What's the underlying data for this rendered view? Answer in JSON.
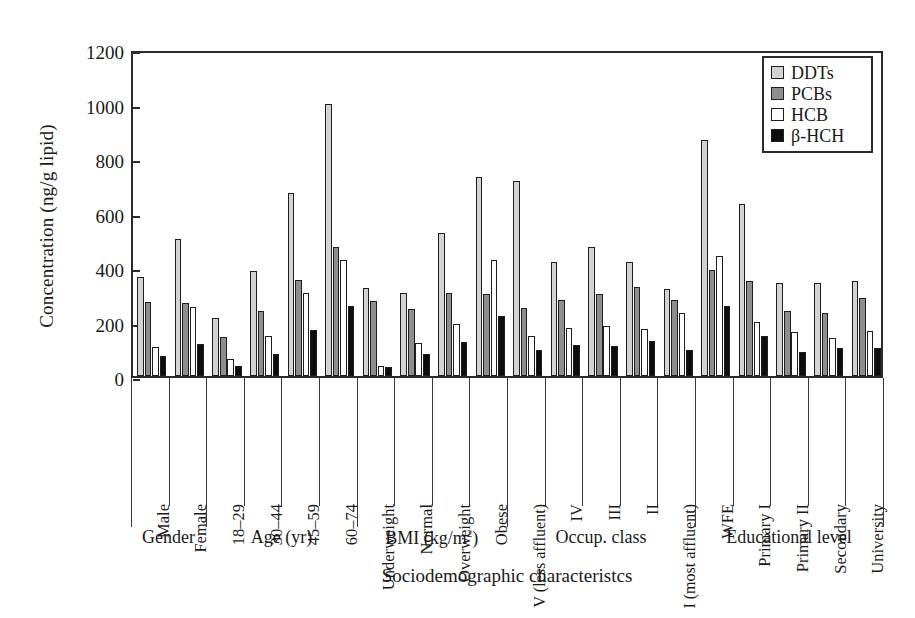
{
  "chart_data": {
    "type": "bar",
    "title": "",
    "xlabel": "Sociodemographic characteristcs",
    "ylabel": "Concentration (ng/g lipid)",
    "ylim": [
      0,
      1200
    ],
    "yticks": [
      0,
      200,
      400,
      600,
      800,
      1000,
      1200
    ],
    "grid": false,
    "legend_position": "top-right",
    "categories": [
      "Male",
      "Female",
      "18–29",
      "30–44",
      "45–59",
      "60–74",
      "Underweight",
      "Normal",
      "Overweight",
      "Obese",
      "V (less affluent)",
      "IV",
      "III",
      "II",
      "I (most affluent)",
      "WFE",
      "Primary I",
      "Primary II",
      "Secondary",
      "University"
    ],
    "series": [
      {
        "name": "DDTs",
        "color": "#d3d3d3",
        "values": [
          365,
          502,
          213,
          387,
          670,
          1000,
          322,
          305,
          525,
          730,
          715,
          420,
          472,
          420,
          320,
          865,
          630,
          340,
          342,
          350
        ]
      },
      {
        "name": "PCBs",
        "color": "#8e8e8e",
        "values": [
          272,
          268,
          145,
          240,
          352,
          475,
          277,
          245,
          303,
          300,
          250,
          280,
          300,
          325,
          280,
          390,
          348,
          240,
          232,
          285
        ]
      },
      {
        "name": "HCB",
        "color": "#ffffff",
        "values": [
          105,
          252,
          62,
          148,
          305,
          425,
          38,
          122,
          192,
          425,
          147,
          178,
          182,
          172,
          232,
          440,
          198,
          160,
          138,
          165
        ]
      },
      {
        "name": "β-HCH",
        "color": "#0d0d0d",
        "values": [
          72,
          118,
          35,
          82,
          170,
          258,
          33,
          80,
          125,
          222,
          95,
          112,
          110,
          128,
          95,
          258,
          148,
          88,
          102,
          102
        ]
      }
    ],
    "supergroups": [
      {
        "label": "Gender",
        "label_html": "Gender",
        "span": [
          0,
          2
        ]
      },
      {
        "label": "Age (yr)",
        "label_html": "Age (yr)",
        "span": [
          2,
          6
        ]
      },
      {
        "label": "BMI (kg/m2)",
        "label_html": "BMI (kg/m<sup>2</sup>)",
        "span": [
          6,
          10
        ]
      },
      {
        "label": "Occup. class",
        "label_html": "Occup. class",
        "span": [
          10,
          15
        ]
      },
      {
        "label": "Educational level",
        "label_html": "Educational level",
        "span": [
          15,
          20
        ]
      }
    ]
  },
  "legend": {
    "items": [
      {
        "label": "DDTs",
        "swatch": "#d3d3d3"
      },
      {
        "label": "PCBs",
        "swatch": "#8e8e8e"
      },
      {
        "label": "HCB",
        "swatch": "#ffffff"
      },
      {
        "label": "β-HCH",
        "swatch": "#0d0d0d"
      }
    ]
  }
}
